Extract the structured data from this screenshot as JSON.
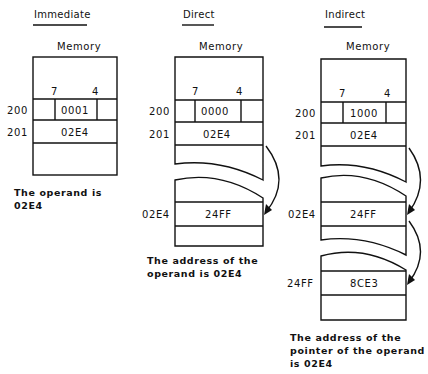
{
  "immediate": {
    "title": "Immediate",
    "memory_label": "Memory",
    "bit_high": "7",
    "bit_low": "4",
    "rows": [
      {
        "address": "200",
        "value": "0001"
      },
      {
        "address": "201",
        "value": "02E4"
      }
    ],
    "caption_line1": "The operand is",
    "caption_line2": "02E4"
  },
  "direct": {
    "title": "Direct",
    "memory_label": "Memory",
    "bit_high": "7",
    "bit_low": "4",
    "rows": [
      {
        "address": "200",
        "value": "0000"
      },
      {
        "address": "201",
        "value": "02E4"
      }
    ],
    "target": {
      "address": "02E4",
      "value": "24FF"
    },
    "caption_line1": "The address of the",
    "caption_line2": "operand is 02E4"
  },
  "indirect": {
    "title": "Indirect",
    "memory_label": "Memory",
    "bit_high": "7",
    "bit_low": "4",
    "rows": [
      {
        "address": "200",
        "value": "1000"
      },
      {
        "address": "201",
        "value": "02E4"
      }
    ],
    "pointer": {
      "address": "02E4",
      "value": "24FF"
    },
    "target": {
      "address": "24FF",
      "value": "8CE3"
    },
    "caption_line1": "The address of the",
    "caption_line2": "pointer of the operand",
    "caption_line3": "is 02E4"
  }
}
